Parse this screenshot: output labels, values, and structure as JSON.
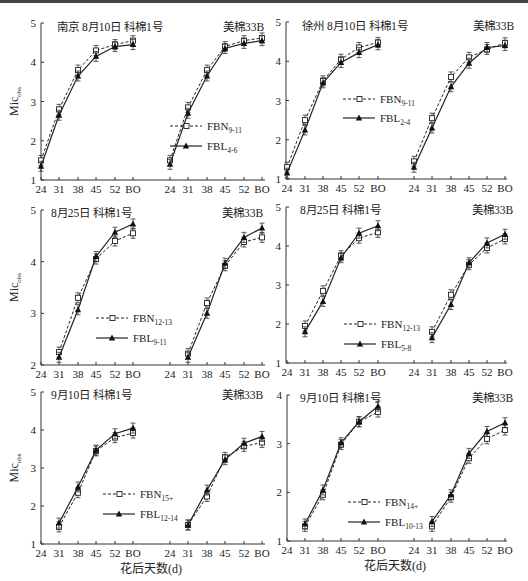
{
  "figure": {
    "x_axis_label": "花后天数(d)",
    "y_axis_label": "Mic",
    "y_axis_label_sub": "obs",
    "x_ticks": [
      "24",
      "31",
      "38",
      "45",
      "52",
      "BO"
    ]
  },
  "chart_data": [
    {
      "type": "line",
      "panel": 1,
      "title_left": "南京 8月10日   科棉1号",
      "title_right": "美棉33B",
      "ylabel": "Mic_obs",
      "xlabel": "",
      "ylim": [
        1,
        5
      ],
      "yticks": [
        1,
        2,
        3,
        4,
        5
      ],
      "categories": [
        "24",
        "31",
        "38",
        "45",
        "52",
        "BO"
      ],
      "legend": [
        "FBN9-11",
        "FBL4-6"
      ],
      "legend_labels": [
        {
          "base": "FBN",
          "sub": "9-11"
        },
        {
          "base": "FBL",
          "sub": "4-6"
        }
      ],
      "groups": [
        {
          "name": "科棉1号",
          "series": [
            {
              "name": "FBN9-11",
              "style": "dashed-square",
              "values": [
                1.5,
                2.8,
                3.8,
                4.3,
                4.45,
                4.55
              ]
            },
            {
              "name": "FBL4-6",
              "style": "solid-triangle",
              "values": [
                1.35,
                2.65,
                3.65,
                4.15,
                4.4,
                4.45
              ]
            }
          ]
        },
        {
          "name": "美棉33B",
          "series": [
            {
              "name": "FBN9-11",
              "style": "dashed-square",
              "values": [
                1.5,
                2.85,
                3.8,
                4.4,
                4.55,
                4.62
              ]
            },
            {
              "name": "FBL4-6",
              "style": "solid-triangle",
              "values": [
                1.4,
                2.7,
                3.65,
                4.35,
                4.48,
                4.55
              ]
            }
          ]
        }
      ]
    },
    {
      "type": "line",
      "panel": 2,
      "title_left": "徐州 8月10日   科棉1号",
      "title_right": "美棉33B",
      "ylim": [
        1,
        5
      ],
      "yticks": [
        1,
        2,
        3,
        4,
        5
      ],
      "categories": [
        "24",
        "31",
        "38",
        "45",
        "52",
        "BO"
      ],
      "legend": [
        "FBN9-11",
        "FBL2-4"
      ],
      "legend_labels": [
        {
          "base": "FBN",
          "sub": "9-11"
        },
        {
          "base": "FBL",
          "sub": "2-4"
        }
      ],
      "groups": [
        {
          "name": "科棉1号",
          "series": [
            {
              "name": "FBN9-11",
              "style": "dashed-square",
              "values": [
                1.3,
                2.5,
                3.5,
                4.05,
                4.35,
                4.48
              ]
            },
            {
              "name": "FBL2-4",
              "style": "solid-triangle",
              "values": [
                1.15,
                2.25,
                3.45,
                3.97,
                4.22,
                4.42
              ]
            }
          ]
        },
        {
          "name": "美棉33B",
          "series": [
            {
              "name": "FBN9-11",
              "style": "dashed-square",
              "values": [
                1.45,
                2.55,
                3.6,
                4.1,
                4.3,
                4.47
              ]
            },
            {
              "name": "FBL2-4",
              "style": "solid-triangle",
              "values": [
                1.3,
                2.3,
                3.35,
                3.95,
                4.35,
                4.4
              ]
            }
          ]
        }
      ]
    },
    {
      "type": "line",
      "panel": 3,
      "title_left": "8月25日   科棉1号",
      "title_right": "美棉33B",
      "ylabel": "Mic_obs",
      "ylim": [
        2,
        5
      ],
      "yticks": [
        2,
        3,
        4,
        5
      ],
      "categories": [
        "24",
        "31",
        "38",
        "45",
        "52",
        "BO"
      ],
      "legend": [
        "FBN12-13",
        "FBL9-11"
      ],
      "legend_labels": [
        {
          "base": "FBN",
          "sub": "12-13"
        },
        {
          "base": "FBL",
          "sub": "9-11"
        }
      ],
      "groups": [
        {
          "name": "科棉1号",
          "series": [
            {
              "name": "FBN12-13",
              "style": "dashed-square",
              "values": [
                null,
                2.25,
                3.3,
                4.05,
                4.4,
                4.55
              ]
            },
            {
              "name": "FBL9-11",
              "style": "solid-triangle",
              "values": [
                null,
                2.15,
                3.07,
                4.1,
                4.57,
                4.73
              ]
            }
          ]
        },
        {
          "name": "美棉33B",
          "series": [
            {
              "name": "FBN12-13",
              "style": "dashed-square",
              "values": [
                null,
                2.22,
                3.2,
                3.92,
                4.38,
                4.47
              ]
            },
            {
              "name": "FBL9-11",
              "style": "solid-triangle",
              "values": [
                null,
                2.15,
                3.0,
                3.97,
                4.47,
                4.65
              ]
            }
          ]
        }
      ]
    },
    {
      "type": "line",
      "panel": 4,
      "title_left": "8月25日   科棉1号",
      "title_right": "美棉33B",
      "ylim": [
        1,
        5
      ],
      "yticks": [
        1,
        2,
        3,
        4,
        5
      ],
      "categories": [
        "24",
        "31",
        "38",
        "45",
        "52",
        "BO"
      ],
      "legend": [
        "FBN12-13",
        "FBL5-8"
      ],
      "legend_labels": [
        {
          "base": "FBN",
          "sub": "12-13"
        },
        {
          "base": "FBL",
          "sub": "5-8"
        }
      ],
      "groups": [
        {
          "name": "科棉1号",
          "series": [
            {
              "name": "FBN12-13",
              "style": "dashed-square",
              "values": [
                null,
                1.95,
                2.85,
                3.75,
                4.2,
                4.35
              ]
            },
            {
              "name": "FBL5-8",
              "style": "solid-triangle",
              "values": [
                null,
                1.8,
                2.58,
                3.7,
                4.33,
                4.52
              ]
            }
          ]
        },
        {
          "name": "美棉33B",
          "series": [
            {
              "name": "FBN12-13",
              "style": "dashed-square",
              "values": [
                null,
                1.8,
                2.75,
                3.52,
                3.95,
                4.18
              ]
            },
            {
              "name": "FBL5-8",
              "style": "solid-triangle",
              "values": [
                null,
                1.65,
                2.5,
                3.57,
                4.08,
                4.3
              ]
            }
          ]
        }
      ]
    },
    {
      "type": "line",
      "panel": 5,
      "title_left": "9月10日   科棉1号",
      "title_right": "美棉33B",
      "ylabel": "Mic_obs",
      "xlabel": "花后天数(d)",
      "ylim": [
        1,
        5
      ],
      "yticks": [
        1,
        2,
        3,
        4,
        5
      ],
      "categories": [
        "24",
        "31",
        "38",
        "45",
        "52",
        "BO"
      ],
      "legend": [
        "FBN15+",
        "FBL12-14"
      ],
      "legend_labels": [
        {
          "base": "FBN",
          "sub": "15+"
        },
        {
          "base": "FBL",
          "sub": "12-14"
        }
      ],
      "groups": [
        {
          "name": "科棉1号",
          "series": [
            {
              "name": "FBN15+",
              "style": "dashed-square",
              "values": [
                null,
                1.45,
                2.35,
                3.45,
                3.8,
                3.92
              ]
            },
            {
              "name": "FBL12-14",
              "style": "solid-triangle",
              "values": [
                null,
                1.55,
                2.5,
                3.47,
                3.9,
                4.05
              ]
            }
          ]
        },
        {
          "name": "美棉33B",
          "series": [
            {
              "name": "FBN15+",
              "style": "dashed-square",
              "values": [
                null,
                1.5,
                2.25,
                3.28,
                3.57,
                3.67
              ]
            },
            {
              "name": "FBL12-14",
              "style": "solid-triangle",
              "values": [
                null,
                1.5,
                2.42,
                3.22,
                3.65,
                3.83
              ]
            }
          ]
        }
      ]
    },
    {
      "type": "line",
      "panel": 6,
      "title_left": "9月10日   科棉1号",
      "title_right": "美棉33B",
      "xlabel": "花后天数(d)",
      "ylim": [
        1,
        4
      ],
      "yticks": [
        1,
        2,
        3,
        4
      ],
      "categories": [
        "24",
        "31",
        "38",
        "45",
        "52",
        "BO"
      ],
      "legend": [
        "FBN14+",
        "FBL10-13"
      ],
      "legend_labels": [
        {
          "base": "FBN",
          "sub": "14+"
        },
        {
          "base": "FBL",
          "sub": "10-13"
        }
      ],
      "groups": [
        {
          "name": "科棉1号",
          "series": [
            {
              "name": "FBN14+",
              "style": "dashed-square",
              "values": [
                null,
                1.3,
                1.95,
                2.98,
                3.45,
                3.65
              ]
            },
            {
              "name": "FBL10-13",
              "style": "solid-triangle",
              "values": [
                null,
                1.35,
                2.05,
                3.02,
                3.45,
                3.77
              ]
            }
          ]
        },
        {
          "name": "美棉33B",
          "series": [
            {
              "name": "FBN14+",
              "style": "dashed-square",
              "values": [
                null,
                1.3,
                1.9,
                2.7,
                3.1,
                3.28
              ]
            },
            {
              "name": "FBL10-13",
              "style": "solid-triangle",
              "values": [
                null,
                1.4,
                1.95,
                2.8,
                3.25,
                3.43
              ]
            }
          ]
        }
      ]
    }
  ],
  "layout_panels": [
    {
      "ax": 41,
      "y_top": 23,
      "y_bot": 180,
      "left_x": [
        41,
        59,
        78,
        96,
        115,
        133
      ],
      "right_x": [
        170,
        188,
        207,
        225,
        244,
        262
      ],
      "x_end": 265,
      "title_left_x": 57,
      "title_right_x": 223,
      "title_y": 27,
      "legend_x": 170,
      "legend_y1": 126,
      "legend_y2": 146,
      "xlabel_y": null
    },
    {
      "ax": 286,
      "y_top": 22,
      "y_bot": 179,
      "left_x": 287,
      "right_x": 414,
      "x_end": 507,
      "title_left_x": 302,
      "title_right_x": 473,
      "title_y": 26,
      "legend_x": 343,
      "legend_y1": 99,
      "legend_y2": 118,
      "xlabel_y": null
    },
    {
      "ax": 41,
      "y_top": 210,
      "y_bot": 365,
      "left_x": [
        41,
        59,
        78,
        96,
        115,
        133
      ],
      "right_x": [
        170,
        188,
        207,
        225,
        244,
        262
      ],
      "x_end": 265,
      "title_left_x": 51,
      "title_right_x": 222,
      "title_y": 213,
      "legend_x": 96,
      "legend_y1": 318,
      "legend_y2": 338,
      "xlabel_y": null
    },
    {
      "ax": 286,
      "y_top": 207,
      "y_bot": 363,
      "left_x": 287,
      "right_x": 414,
      "x_end": 507,
      "title_left_x": 300,
      "title_right_x": 472,
      "title_y": 210,
      "legend_x": 344,
      "legend_y1": 324,
      "legend_y2": 344,
      "xlabel_y": null
    },
    {
      "ax": 41,
      "y_top": 392,
      "y_bot": 544,
      "left_x": [
        41,
        59,
        78,
        96,
        115,
        133
      ],
      "right_x": [
        170,
        188,
        207,
        225,
        244,
        262
      ],
      "x_end": 265,
      "title_left_x": 51,
      "title_right_x": 222,
      "title_y": 395,
      "legend_x": 103,
      "legend_y1": 494,
      "legend_y2": 514,
      "xlabel_y": 573
    },
    {
      "ax": 287,
      "y_top": 395,
      "y_bot": 541,
      "left_x": 287,
      "right_x": 414,
      "x_end": 507,
      "title_left_x": 300,
      "title_right_x": 472,
      "title_y": 398,
      "legend_x": 348,
      "legend_y1": 502,
      "legend_y2": 522,
      "xlabel_y": 570
    }
  ]
}
